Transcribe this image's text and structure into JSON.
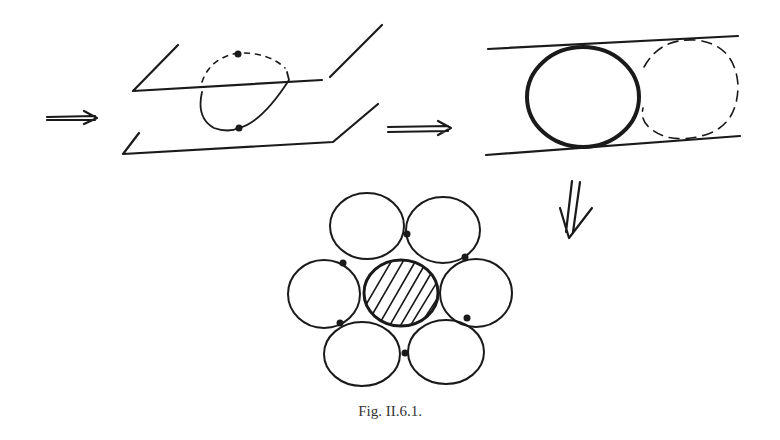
{
  "figure": {
    "caption": "Fig. II.6.1.",
    "colors": {
      "ink": "#1a1a1a",
      "background": "#ffffff"
    },
    "panels": [
      {
        "id": "sphere-between-planes",
        "description": "Sphere pinched between two parallel planes, contact points marked, upper half dashed"
      },
      {
        "id": "circle-in-strip",
        "description": "Bold circle in a strip between two lines with a dashed neighboring circle"
      },
      {
        "id": "hexagonal-packing",
        "description": "Hatched central disk surrounded by six disks with contact points"
      }
    ],
    "arrows": [
      {
        "id": "arrow-left",
        "symbol": "⇒"
      },
      {
        "id": "arrow-middle",
        "symbol": "⇒"
      },
      {
        "id": "arrow-down",
        "symbol": "⇓"
      }
    ]
  }
}
